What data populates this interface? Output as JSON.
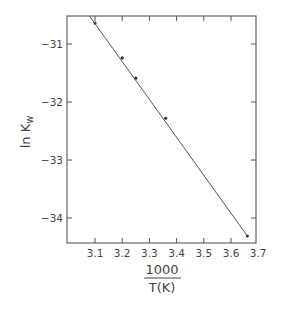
{
  "chart_data": {
    "type": "scatter",
    "title": "",
    "xlabel": "1000 / T(K)",
    "xlabel_numerator": "1000",
    "xlabel_denominator": "T(K)",
    "ylabel": "ln K_w",
    "ylabel_main": "ln K",
    "ylabel_sub": "w",
    "xlim": [
      3.0,
      3.7
    ],
    "ylim": [
      -34.5,
      -30.4
    ],
    "grid": false,
    "legend": null,
    "xticks": [
      3.1,
      3.2,
      3.3,
      3.4,
      3.5,
      3.6,
      3.7
    ],
    "xtick_labels": [
      "3.1",
      "3.2",
      "3.3",
      "3.4",
      "3.5",
      "3.6",
      "3.7"
    ],
    "yticks": [
      -31,
      -32,
      -33,
      -34
    ],
    "ytick_labels": [
      "−31",
      "−32",
      "−33",
      "−34"
    ],
    "series": [
      {
        "name": "measured",
        "type": "scatter",
        "x": [
          3.1,
          3.2,
          3.25,
          3.36,
          3.66
        ],
        "y": [
          -30.64,
          -31.24,
          -31.59,
          -32.28,
          -34.31
        ]
      },
      {
        "name": "linear fit",
        "type": "line",
        "x": [
          3.08,
          3.66
        ],
        "y": [
          -30.5,
          -34.31
        ]
      }
    ]
  }
}
